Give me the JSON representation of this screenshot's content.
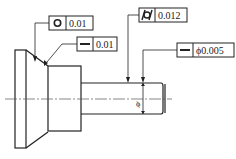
{
  "drawing": {
    "title": "Shaft with geometric tolerances",
    "colors": {
      "line": "#222222",
      "centerline": "#555555",
      "background": "#ffffff"
    },
    "feature_control_frames": [
      {
        "id": "circularity",
        "symbol": "circularity-icon",
        "value": "0.01"
      },
      {
        "id": "straightness-taper",
        "symbol": "straightness-icon",
        "value": "0.01"
      },
      {
        "id": "cylindricity",
        "symbol": "cylindricity-icon",
        "value": "0.012"
      },
      {
        "id": "straightness-axis",
        "symbol": "straightness-icon",
        "value": "ϕ0.005"
      }
    ],
    "dimension": {
      "symbol": "ϕ"
    }
  }
}
